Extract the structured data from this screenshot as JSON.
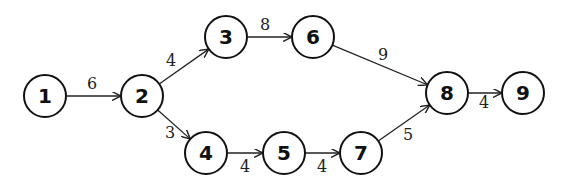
{
  "diagram": {
    "type": "directed-network",
    "node_radius": 21,
    "colors": {
      "stroke": "#111111",
      "background": "#ffffff"
    },
    "nodes": [
      {
        "id": "1",
        "label": "1",
        "x": 45,
        "y": 96
      },
      {
        "id": "2",
        "label": "2",
        "x": 142,
        "y": 96
      },
      {
        "id": "3",
        "label": "3",
        "x": 226,
        "y": 37
      },
      {
        "id": "4",
        "label": "4",
        "x": 206,
        "y": 153
      },
      {
        "id": "5",
        "label": "5",
        "x": 284,
        "y": 153
      },
      {
        "id": "6",
        "label": "6",
        "x": 313,
        "y": 37
      },
      {
        "id": "7",
        "label": "7",
        "x": 361,
        "y": 153
      },
      {
        "id": "8",
        "label": "8",
        "x": 447,
        "y": 93
      },
      {
        "id": "9",
        "label": "9",
        "x": 523,
        "y": 93
      }
    ],
    "edges": [
      {
        "from": "1",
        "to": "2",
        "weight": "6",
        "lx": 92,
        "ly": 89
      },
      {
        "from": "2",
        "to": "3",
        "weight": "4",
        "lx": 171,
        "ly": 66
      },
      {
        "from": "2",
        "to": "4",
        "weight": "3",
        "lx": 170,
        "ly": 138
      },
      {
        "from": "3",
        "to": "6",
        "weight": "8",
        "lx": 265,
        "ly": 30
      },
      {
        "from": "6",
        "to": "8",
        "weight": "9",
        "lx": 383,
        "ly": 60
      },
      {
        "from": "4",
        "to": "5",
        "weight": "4",
        "lx": 245,
        "ly": 172
      },
      {
        "from": "5",
        "to": "7",
        "weight": "4",
        "lx": 322,
        "ly": 172
      },
      {
        "from": "7",
        "to": "8",
        "weight": "5",
        "lx": 408,
        "ly": 140
      },
      {
        "from": "8",
        "to": "9",
        "weight": "4",
        "lx": 484,
        "ly": 108
      }
    ]
  }
}
